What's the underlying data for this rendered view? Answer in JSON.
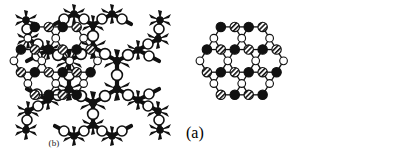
{
  "figure": {
    "background_color": "#ffffff",
    "ink_color": "#111111",
    "panels": [
      {
        "id": "molecule",
        "kind": "ball-and-stick-model",
        "label": "",
        "description": "dendritic six-fold snowflake molecular model"
      },
      {
        "id": "a",
        "kind": "hexagonal-lattice-schematic",
        "label": "(a)"
      },
      {
        "id": "b",
        "kind": "hexagonal-lattice-schematic",
        "label": "(b)"
      }
    ],
    "node_legend": [
      {
        "key": "filled",
        "name": "filled-node",
        "color": "#111111",
        "fill": "solid-black"
      },
      {
        "key": "hatched",
        "name": "hatched-node",
        "color": "#111111",
        "fill": "diagonal-hatch"
      },
      {
        "key": "hollow",
        "name": "hollow-node",
        "color": "#ffffff",
        "fill": "open-white"
      }
    ]
  },
  "chart_data": {
    "type": "diagram",
    "title": "",
    "panels": [
      {
        "id": "a",
        "label": "(a)",
        "type": "graph",
        "node_types": [
          "filled",
          "hatched",
          "hollow"
        ],
        "nodes": [
          {
            "id": "a1",
            "x": 36,
            "y": 14,
            "type": "filled"
          },
          {
            "id": "a2",
            "x": 52,
            "y": 14,
            "type": "hatched"
          },
          {
            "id": "a3",
            "x": 68,
            "y": 14,
            "type": "filled"
          },
          {
            "id": "a4",
            "x": 84,
            "y": 14,
            "type": "hatched"
          },
          {
            "id": "a5",
            "x": 28,
            "y": 27,
            "type": "hollow"
          },
          {
            "id": "a6",
            "x": 60,
            "y": 27,
            "type": "hollow"
          },
          {
            "id": "a7",
            "x": 92,
            "y": 27,
            "type": "hollow"
          },
          {
            "id": "a8",
            "x": 20,
            "y": 40,
            "type": "filled"
          },
          {
            "id": "a9",
            "x": 36,
            "y": 40,
            "type": "hatched"
          },
          {
            "id": "a10",
            "x": 52,
            "y": 40,
            "type": "filled"
          },
          {
            "id": "a11",
            "x": 68,
            "y": 40,
            "type": "hatched"
          },
          {
            "id": "a12",
            "x": 84,
            "y": 40,
            "type": "filled"
          },
          {
            "id": "a13",
            "x": 100,
            "y": 40,
            "type": "hatched"
          },
          {
            "id": "a14",
            "x": 12,
            "y": 53,
            "type": "hollow"
          },
          {
            "id": "a15",
            "x": 44,
            "y": 53,
            "type": "hollow"
          },
          {
            "id": "a16",
            "x": 76,
            "y": 53,
            "type": "hollow"
          },
          {
            "id": "a17",
            "x": 108,
            "y": 53,
            "type": "hollow"
          },
          {
            "id": "a18",
            "x": 20,
            "y": 66,
            "type": "hatched"
          },
          {
            "id": "a19",
            "x": 36,
            "y": 66,
            "type": "filled"
          },
          {
            "id": "a20",
            "x": 52,
            "y": 66,
            "type": "hatched"
          },
          {
            "id": "a21",
            "x": 68,
            "y": 66,
            "type": "filled"
          },
          {
            "id": "a22",
            "x": 84,
            "y": 66,
            "type": "hatched"
          },
          {
            "id": "a23",
            "x": 100,
            "y": 66,
            "type": "filled"
          },
          {
            "id": "a24",
            "x": 28,
            "y": 79,
            "type": "hollow"
          },
          {
            "id": "a25",
            "x": 60,
            "y": 79,
            "type": "hollow"
          },
          {
            "id": "a26",
            "x": 92,
            "y": 79,
            "type": "hollow"
          },
          {
            "id": "a27",
            "x": 36,
            "y": 92,
            "type": "hatched"
          },
          {
            "id": "a28",
            "x": 52,
            "y": 92,
            "type": "filled"
          },
          {
            "id": "a29",
            "x": 68,
            "y": 92,
            "type": "hatched"
          },
          {
            "id": "a30",
            "x": 84,
            "y": 92,
            "type": "filled"
          }
        ]
      },
      {
        "id": "b",
        "label": "(b)",
        "type": "graph",
        "node_types": [
          "filled",
          "hatched",
          "hollow"
        ],
        "nodes": [
          {
            "id": "b1",
            "x": 36,
            "y": 14,
            "type": "filled"
          },
          {
            "id": "b2",
            "x": 52,
            "y": 14,
            "type": "hatched"
          },
          {
            "id": "b3",
            "x": 68,
            "y": 14,
            "type": "filled"
          },
          {
            "id": "b4",
            "x": 84,
            "y": 14,
            "type": "hatched"
          },
          {
            "id": "b5",
            "x": 28,
            "y": 27,
            "type": "hollow"
          },
          {
            "id": "b6",
            "x": 60,
            "y": 27,
            "type": "hollow"
          },
          {
            "id": "b7",
            "x": 92,
            "y": 27,
            "type": "hollow"
          },
          {
            "id": "b8",
            "x": 20,
            "y": 40,
            "type": "filled"
          },
          {
            "id": "b9",
            "x": 36,
            "y": 40,
            "type": "hatched"
          },
          {
            "id": "b10",
            "x": 52,
            "y": 40,
            "type": "filled"
          },
          {
            "id": "b11",
            "x": 68,
            "y": 40,
            "type": "hatched"
          },
          {
            "id": "b12",
            "x": 84,
            "y": 40,
            "type": "filled"
          },
          {
            "id": "b13",
            "x": 100,
            "y": 40,
            "type": "hatched"
          },
          {
            "id": "b14",
            "x": 12,
            "y": 53,
            "type": "hollow"
          },
          {
            "id": "b15",
            "x": 44,
            "y": 53,
            "type": "hollow"
          },
          {
            "id": "b16",
            "x": 76,
            "y": 53,
            "type": "hollow"
          },
          {
            "id": "b17",
            "x": 108,
            "y": 53,
            "type": "hollow"
          },
          {
            "id": "b18",
            "x": 20,
            "y": 66,
            "type": "hatched"
          },
          {
            "id": "b19",
            "x": 36,
            "y": 66,
            "type": "filled"
          },
          {
            "id": "b20",
            "x": 52,
            "y": 66,
            "type": "hatched"
          },
          {
            "id": "b21",
            "x": 68,
            "y": 66,
            "type": "filled"
          },
          {
            "id": "b22",
            "x": 84,
            "y": 66,
            "type": "hatched"
          },
          {
            "id": "b23",
            "x": 100,
            "y": 66,
            "type": "filled"
          },
          {
            "id": "b24",
            "x": 28,
            "y": 79,
            "type": "hollow"
          },
          {
            "id": "b25",
            "x": 60,
            "y": 79,
            "type": "hollow"
          },
          {
            "id": "b26",
            "x": 92,
            "y": 79,
            "type": "hollow"
          },
          {
            "id": "b27",
            "x": 36,
            "y": 92,
            "type": "hatched"
          },
          {
            "id": "b28",
            "x": 52,
            "y": 92,
            "type": "filled"
          },
          {
            "id": "b29",
            "x": 68,
            "y": 92,
            "type": "hatched"
          },
          {
            "id": "b30",
            "x": 84,
            "y": 92,
            "type": "filled"
          }
        ]
      }
    ]
  }
}
